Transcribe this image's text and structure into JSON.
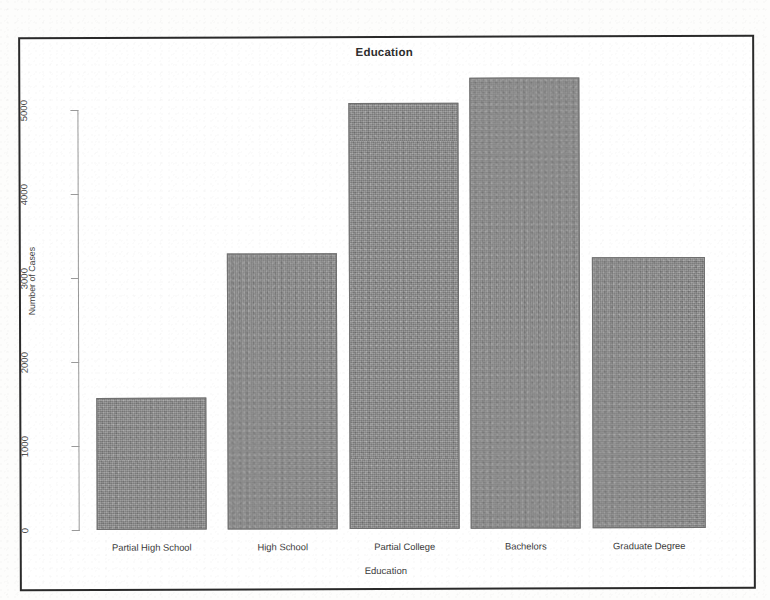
{
  "chart_data": {
    "type": "bar",
    "title": "Education",
    "xlabel": "Education",
    "ylabel": "Number of Cases",
    "categories": [
      "Partial High School",
      "High School",
      "Partial College",
      "Bachelors",
      "Graduate Degree"
    ],
    "values": [
      1570,
      3290,
      5070,
      5370,
      3230
    ],
    "yticks": [
      "0",
      "1000",
      "2000",
      "3000",
      "4000",
      "5000"
    ],
    "ylim": [
      0,
      5500
    ],
    "grid": false,
    "legend": false,
    "bar_color": "#8b8b8b",
    "axis_color": "#9a9a9a",
    "border_color": "#2a2a2a"
  },
  "figure": {
    "title": "Education",
    "x_axis_title": "Education",
    "y_axis_title": "Number of Cases",
    "y_tick_labels": [
      "0",
      "1000",
      "2000",
      "3000",
      "4000",
      "5000"
    ],
    "bars": [
      {
        "label": "Partial High School",
        "value": 1570
      },
      {
        "label": "High School",
        "value": 3290
      },
      {
        "label": "Partial College",
        "value": 5070
      },
      {
        "label": "Bachelors",
        "value": 5370
      },
      {
        "label": "Graduate Degree",
        "value": 3230
      }
    ]
  }
}
